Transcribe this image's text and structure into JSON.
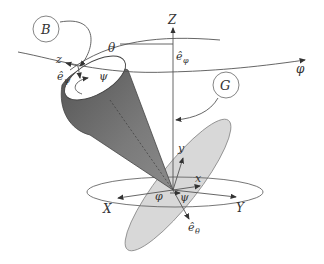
{
  "diagram": {
    "labels": {
      "B": "B",
      "G": "G",
      "Z_axis": "Z",
      "X_axis": "X",
      "Y_axis": "Y",
      "z_body": "z",
      "x_body": "x",
      "y_body": "y",
      "theta": "θ",
      "phi_top": "φ",
      "phi_bottom": "φ",
      "psi_top": "ψ",
      "psi_bottom": "ψ",
      "e_phi": "ê",
      "e_phi_sub": "φ",
      "e_psi": "ê",
      "e_psi_sub": "ψ",
      "e_theta": "ê",
      "e_theta_sub": "θ"
    },
    "colors": {
      "cone": "#6e6e6e",
      "cone_dark": "#4a4a4a",
      "plane": "#d6d6d6",
      "line": "#555555"
    }
  }
}
